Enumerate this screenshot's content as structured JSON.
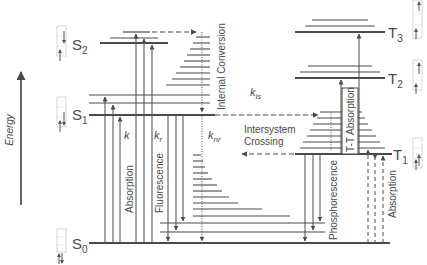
{
  "diagram": {
    "axis": {
      "label": "Energy",
      "direction": "up"
    },
    "states": {
      "S0": {
        "letter": "S",
        "sub": "0",
        "spin": "paired up-down"
      },
      "S1": {
        "letter": "S",
        "sub": "1",
        "spin": "singlet excited (up, down)"
      },
      "S2": {
        "letter": "S",
        "sub": "2",
        "spin": "singlet excited (down, up)"
      },
      "T1": {
        "letter": "T",
        "sub": "1",
        "spin": "parallel (up, up)"
      },
      "T2": {
        "letter": "T",
        "sub": "2",
        "spin": "parallel (up, up)"
      },
      "T3": {
        "letter": "T",
        "sub": "3",
        "spin": "parallel (up, up)"
      }
    },
    "processes": {
      "absorption": "Absorption",
      "fluorescence": "Fluorescence",
      "internal_conversion": "Internal Conversion",
      "intersystem_crossing_line1": "Intersystem",
      "intersystem_crossing_line2": "Crossing",
      "phosphorescence": "Phosphorescence",
      "tt_absorption": "T-T Absorption",
      "t_absorption": "Absorption"
    },
    "rates": {
      "k": {
        "main": "k",
        "sub": ""
      },
      "kr": {
        "main": "k",
        "sub": "r"
      },
      "knr": {
        "main": "k",
        "sub": "nr"
      },
      "kis": {
        "main": "k",
        "sub": "is"
      }
    },
    "colors": {
      "line": "#4a4a4a",
      "box": "#cccccc",
      "background": "#ffffff"
    }
  }
}
